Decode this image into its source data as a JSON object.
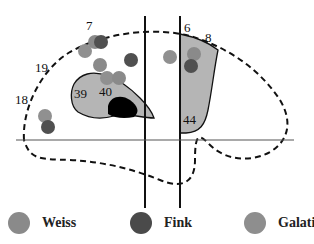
{
  "diagram": {
    "type": "brain-lateral-view-activation-map",
    "area_labels": [
      {
        "id": "7",
        "text": "7",
        "x": 86,
        "y": 30
      },
      {
        "id": "19",
        "text": "19",
        "x": 35,
        "y": 72
      },
      {
        "id": "18",
        "text": "18",
        "x": 15,
        "y": 104
      },
      {
        "id": "39",
        "text": "39",
        "x": 74,
        "y": 98
      },
      {
        "id": "40",
        "text": "40",
        "x": 99,
        "y": 96
      },
      {
        "id": "6",
        "text": "6",
        "x": 184,
        "y": 32
      },
      {
        "id": "8",
        "text": "8",
        "x": 205,
        "y": 42
      },
      {
        "id": "44",
        "text": "44",
        "x": 183,
        "y": 124
      }
    ],
    "colors": {
      "outline": "#111111",
      "region_fill": "#b5b5b5",
      "central_spot": "#000000",
      "weiss": "#8a8a8a",
      "fink": "#505050",
      "galati": "#909090"
    },
    "activation_points": [
      {
        "study": "Weiss",
        "x": 95,
        "y": 42
      },
      {
        "study": "Fink",
        "x": 101,
        "y": 42
      },
      {
        "study": "Galati",
        "x": 85,
        "y": 51
      },
      {
        "study": "Weiss",
        "x": 100,
        "y": 65
      },
      {
        "study": "Fink",
        "x": 131,
        "y": 60
      },
      {
        "study": "Galati",
        "x": 107,
        "y": 78
      },
      {
        "study": "Weiss",
        "x": 119,
        "y": 78
      },
      {
        "study": "Galati",
        "x": 170,
        "y": 57
      },
      {
        "study": "Weiss",
        "x": 194,
        "y": 54
      },
      {
        "study": "Fink",
        "x": 191,
        "y": 66
      },
      {
        "study": "Galati",
        "x": 45,
        "y": 116
      },
      {
        "study": "Fink",
        "x": 48,
        "y": 127
      }
    ]
  },
  "legend": {
    "items": [
      {
        "label": "Weiss",
        "color": "#8a8a8a"
      },
      {
        "label": "Fink",
        "color": "#4a4a4a"
      },
      {
        "label": "Galati",
        "color": "#8e8e8e"
      }
    ]
  }
}
